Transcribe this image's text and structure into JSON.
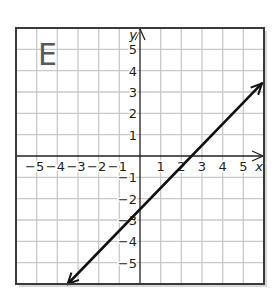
{
  "panel": {
    "label": "E"
  },
  "colors": {
    "grid": "#c9c9c9",
    "axis": "#231f20",
    "border": "#3a3a3a",
    "line": "#111111",
    "label_gray": "#58595b",
    "shadow": "#bdbdbd"
  },
  "chart_data": {
    "type": "line",
    "title": "E",
    "xlabel": "x",
    "ylabel": "y",
    "xlim": [
      -6,
      6
    ],
    "ylim": [
      -6,
      6
    ],
    "grid": true,
    "x_ticks": [
      -5,
      -4,
      -3,
      -2,
      -1,
      1,
      2,
      3,
      4,
      5
    ],
    "y_ticks": [
      -5,
      -4,
      -3,
      -2,
      -1,
      1,
      2,
      3,
      4,
      5
    ],
    "x_tick_labels": [
      "−5",
      "−4",
      "−3",
      "−2",
      "−1",
      "1",
      "2",
      "3",
      "4",
      "5"
    ],
    "y_tick_labels": [
      "−5",
      "−4",
      "−3",
      "−2",
      "−1",
      "1",
      "2",
      "3",
      "4",
      "5"
    ],
    "series": [
      {
        "name": "line",
        "equation": "y = x - 2.5",
        "slope": 1,
        "y_intercept": -2.5,
        "x_intercept": 2.5,
        "x": [
          -3.5,
          5.9
        ],
        "y": [
          -6,
          3.4
        ],
        "arrows": "both"
      }
    ]
  }
}
